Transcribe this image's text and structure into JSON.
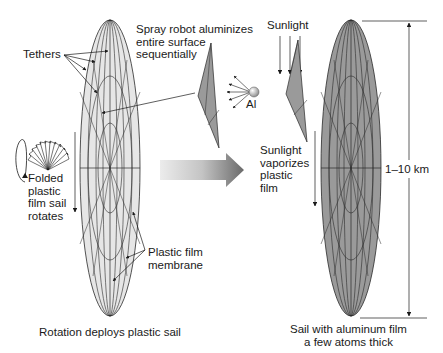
{
  "labels": {
    "tethers": "Tethers",
    "spray_robot": "Spray robot aluminizes\nentire surface\nsequentially",
    "aluminum_symbol": "Al",
    "sunlight_top": "Sunlight",
    "folded_sail": "Folded\nplastic\nfilm sail\nrotates",
    "sunlight_vaporizes": "Sunlight\nvaporizes\nplastic\nfilm",
    "dimension": "1–10 km",
    "plastic_membrane": "Plastic film\nmembrane",
    "caption_left": "Rotation deploys plastic sail",
    "caption_right": "Sail with aluminum film\na few atoms thick"
  },
  "colors": {
    "plastic_sail_fill": "#e6e6e6",
    "aluminum_sail_fill": "#9a9a9a",
    "line": "#2a2a2a",
    "arrow_gradient_start": "#e8e8e8",
    "arrow_gradient_end": "#707070"
  },
  "icons": {
    "rotation": "rotation-arrow-icon",
    "aluminum_atom": "sphere-icon",
    "process_arrow": "right-arrow-icon"
  }
}
